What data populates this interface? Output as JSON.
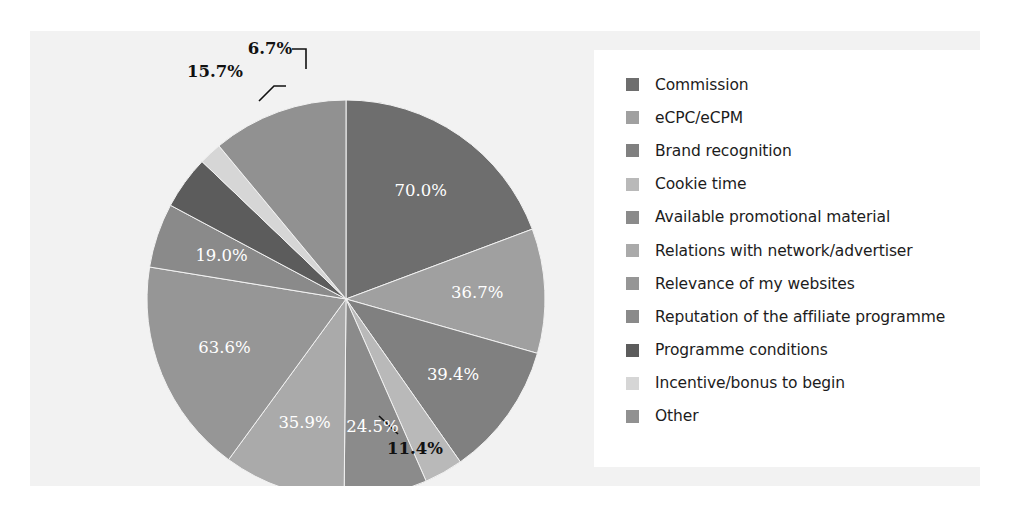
{
  "colors": {
    "page_background": "#ffffff",
    "chart_background": "#f2f2f2",
    "legend_background": "#ffffff",
    "inside_label_color": "#ffffff",
    "outside_label_color": "#111111"
  },
  "legend": {
    "items": [
      {
        "label": "Commission",
        "color": "#6e6e6e"
      },
      {
        "label": "eCPC/eCPM",
        "color": "#a0a0a0"
      },
      {
        "label": "Brand recognition",
        "color": "#808080"
      },
      {
        "label": "Cookie time",
        "color": "#b9b9b9"
      },
      {
        "label": "Available promotional material",
        "color": "#8b8b8b"
      },
      {
        "label": "Relations with network/advertiser",
        "color": "#aaaaaa"
      },
      {
        "label": "Relevance of my websites",
        "color": "#969696"
      },
      {
        "label": "Reputation of the affiliate programme",
        "color": "#8a8a8a"
      },
      {
        "label": "Programme conditions",
        "color": "#5c5c5c"
      },
      {
        "label": "Incentive/bonus to begin",
        "color": "#d6d6d6"
      },
      {
        "label": "Other",
        "color": "#919191"
      }
    ]
  },
  "chart_data": {
    "type": "pie",
    "title": "",
    "subtitle": "",
    "xlabel": "",
    "ylabel": "",
    "grid": false,
    "legend_position": "right",
    "start_angle_deg": 0,
    "direction": "clockwise",
    "note": "Multi-select survey: percentages are share of respondents and sum to 362.9%; slice angles are proportional to each value's share of that total.",
    "total_of_values": 362.9,
    "categories": [
      "Commission",
      "eCPC/eCPM",
      "Brand recognition",
      "Cookie time",
      "Available promotional material",
      "Relations with network/advertiser",
      "Relevance of my websites",
      "Reputation of the affiliate programme",
      "Programme conditions",
      "Incentive/bonus to begin",
      "Other"
    ],
    "values": [
      70.0,
      36.7,
      39.4,
      11.4,
      24.5,
      35.9,
      63.6,
      19.0,
      15.7,
      6.7,
      40.0
    ],
    "data_labels": [
      "70.0%",
      "36.7%",
      "39.4%",
      "11.4%",
      "24.5%",
      "35.9%",
      "63.6%",
      "19.0%",
      "15.7%",
      "6.7%",
      ""
    ],
    "label_placement": [
      "inside",
      "inside",
      "inside",
      "outside",
      "inside",
      "inside",
      "inside",
      "inside",
      "outside",
      "outside",
      "none"
    ],
    "colors": [
      "#6e6e6e",
      "#a0a0a0",
      "#808080",
      "#b9b9b9",
      "#8b8b8b",
      "#aaaaaa",
      "#969696",
      "#8a8a8a",
      "#5c5c5c",
      "#d6d6d6",
      "#919191"
    ],
    "geometry": {
      "cx": 316,
      "cy": 268,
      "r": 199
    }
  }
}
